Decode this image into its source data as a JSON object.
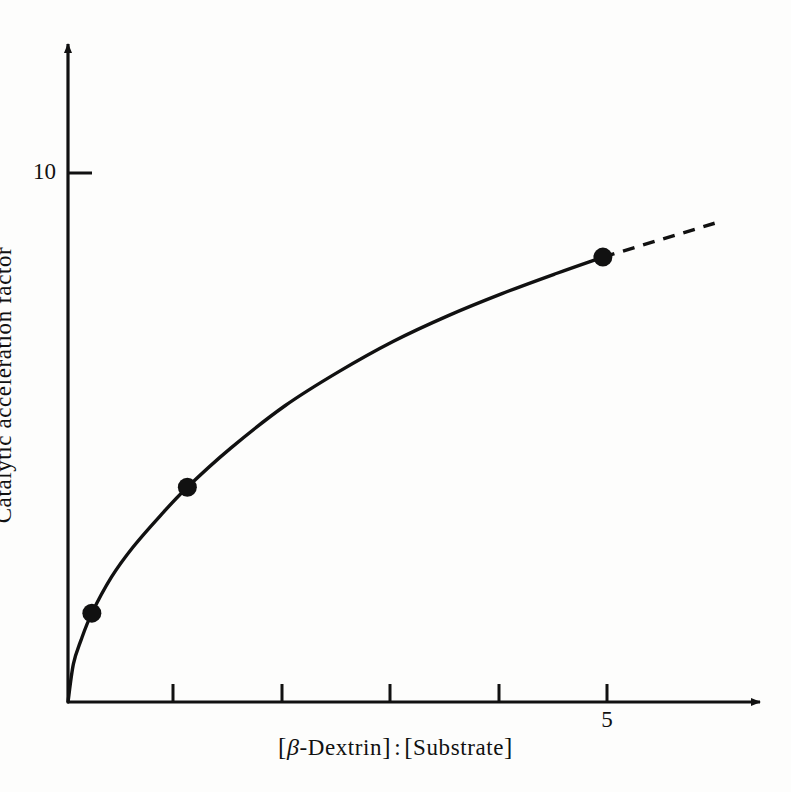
{
  "figure": {
    "background_color": "#fdfdfc",
    "ink_color": "#111111"
  },
  "axes": {
    "y": {
      "label": "Catalytic acceleration factor",
      "ticks": [
        {
          "value": 10,
          "label": "10"
        }
      ],
      "arrow": true
    },
    "x": {
      "label_parts": {
        "open1": "[",
        "beta": "β",
        "dash": "-",
        "dextrin": "Dextrin",
        "close1": "]",
        "colon": ":",
        "open2": "[",
        "substrate": "Substrate",
        "close2": "]"
      },
      "label_plain": "[β-Dextrin] : [Substrate]",
      "ticks": [
        {
          "value": 1,
          "label": ""
        },
        {
          "value": 2,
          "label": ""
        },
        {
          "value": 3,
          "label": ""
        },
        {
          "value": 4,
          "label": ""
        },
        {
          "value": 5,
          "label": "5"
        }
      ],
      "arrow": true
    }
  },
  "chart_data": {
    "type": "line",
    "title": "",
    "subtitle": "",
    "xlabel": "[β-Dextrin] : [Substrate]",
    "ylabel": "Catalytic acceleration factor",
    "xlim": [
      0,
      6.45
    ],
    "ylim": [
      0,
      12.6
    ],
    "grid": false,
    "legend": null,
    "annotations": [],
    "series": [
      {
        "name": "Catalytic acceleration factor",
        "style": "solid-curve-with-markers",
        "marker": "filled-circle",
        "points": [
          {
            "x": 0.0,
            "y": 0.0
          },
          {
            "x": 0.22,
            "y": 1.68
          },
          {
            "x": 1.1,
            "y": 4.06
          },
          {
            "x": 4.93,
            "y": 8.41
          }
        ],
        "curve_samples": [
          {
            "x": 0.0,
            "y": 0.0
          },
          {
            "x": 0.05,
            "y": 0.72
          },
          {
            "x": 0.12,
            "y": 1.17
          },
          {
            "x": 0.22,
            "y": 1.68
          },
          {
            "x": 0.4,
            "y": 2.36
          },
          {
            "x": 0.6,
            "y": 2.93
          },
          {
            "x": 0.85,
            "y": 3.52
          },
          {
            "x": 1.1,
            "y": 4.06
          },
          {
            "x": 1.5,
            "y": 4.8
          },
          {
            "x": 2.0,
            "y": 5.6
          },
          {
            "x": 2.5,
            "y": 6.25
          },
          {
            "x": 3.0,
            "y": 6.82
          },
          {
            "x": 3.5,
            "y": 7.3
          },
          {
            "x": 4.0,
            "y": 7.72
          },
          {
            "x": 4.5,
            "y": 8.1
          },
          {
            "x": 4.93,
            "y": 8.41
          }
        ]
      },
      {
        "name": "extrapolation",
        "style": "dashed-line",
        "marker": "none",
        "points": [
          {
            "x": 4.93,
            "y": 8.41
          },
          {
            "x": 5.96,
            "y": 9.05
          }
        ]
      }
    ]
  }
}
